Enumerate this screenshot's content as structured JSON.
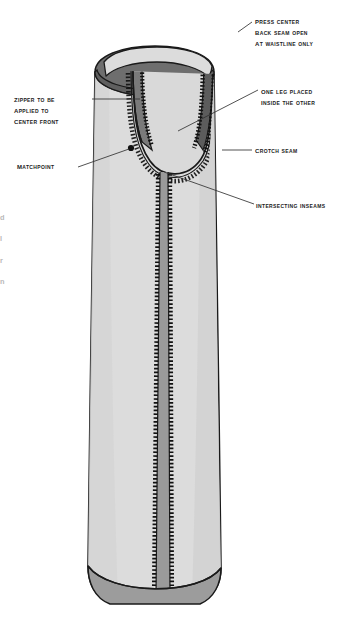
{
  "document": {
    "type": "technical-sewing-illustration",
    "subject": "trouser leg construction",
    "background_color": "#ffffff"
  },
  "palette": {
    "fabric_light": "#dcdcdc",
    "fabric_shade": "#cfcfcf",
    "inner_dark": "#6e6e6e",
    "seam_dark": "#8a8a8a",
    "outline": "#1a1a1a",
    "stitch": "#111111",
    "leader": "#333333",
    "text": "#1b1b1b"
  },
  "callouts": [
    {
      "id": "press-center-back-seam",
      "lines": [
        "Press center",
        "back seam open",
        "at waistline only"
      ],
      "side": "right"
    },
    {
      "id": "one-leg-placed-inside",
      "lines": [
        "One leg placed",
        "inside the other"
      ],
      "side": "right"
    },
    {
      "id": "crotch-seam",
      "lines": [
        "Crotch seam"
      ],
      "side": "right"
    },
    {
      "id": "intersecting-inseams",
      "lines": [
        "Intersecting inseams"
      ],
      "side": "right"
    },
    {
      "id": "zipper-to-be-applied",
      "lines": [
        "Zipper to be",
        "applied to",
        "center front"
      ],
      "side": "left"
    },
    {
      "id": "matchpoint",
      "lines": [
        "Matchpoint"
      ],
      "side": "left"
    }
  ],
  "edge_fragments": [
    "d",
    "l",
    "r",
    "n"
  ]
}
